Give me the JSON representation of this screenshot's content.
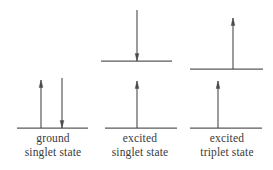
{
  "figure": {
    "background_color": "#ffffff",
    "line_color": "#5a5a5a",
    "arrow_color": "#4a4a4a",
    "text_color": "#3a3a3a"
  },
  "chart_data": {
    "type": "diagram",
    "title": "",
    "groups": [
      {
        "id": "ground-singlet",
        "label_line1": "ground",
        "label_line2": "singlet state",
        "levels": [
          {
            "name": "lower-level",
            "y": 128,
            "x1": 17,
            "x2": 88,
            "arrows": [
              {
                "name": "spin-up",
                "direction": "up",
                "x": 41,
                "top": 80,
                "bottom": 128
              },
              {
                "name": "spin-down",
                "direction": "down",
                "x": 62,
                "top": 78,
                "bottom": 128
              }
            ]
          }
        ]
      },
      {
        "id": "excited-singlet",
        "label_line1": "excited",
        "label_line2": "singlet state",
        "levels": [
          {
            "name": "upper-level",
            "y": 61,
            "x1": 101,
            "x2": 172,
            "arrows": [
              {
                "name": "spin-down",
                "direction": "down",
                "x": 137,
                "top": 10,
                "bottom": 61
              }
            ]
          },
          {
            "name": "lower-level",
            "y": 128,
            "x1": 105,
            "x2": 177,
            "arrows": [
              {
                "name": "spin-up",
                "direction": "up",
                "x": 137,
                "top": 81,
                "bottom": 128
              }
            ]
          }
        ]
      },
      {
        "id": "excited-triplet",
        "label_line1": "excited",
        "label_line2": "triplet state",
        "levels": [
          {
            "name": "upper-level",
            "y": 69,
            "x1": 190,
            "x2": 263,
            "arrows": [
              {
                "name": "spin-up",
                "direction": "up",
                "x": 233,
                "top": 18,
                "bottom": 69
              }
            ]
          },
          {
            "name": "lower-level",
            "y": 128,
            "x1": 190,
            "x2": 262,
            "arrows": [
              {
                "name": "spin-up",
                "direction": "up",
                "x": 218,
                "top": 81,
                "bottom": 128
              }
            ]
          }
        ]
      }
    ]
  },
  "labels": {
    "ground": {
      "line1": "ground",
      "line2": "singlet state"
    },
    "excited_singlet": {
      "line1": "excited",
      "line2": "singlet state"
    },
    "excited_triplet": {
      "line1": "excited",
      "line2": "triplet state"
    }
  }
}
